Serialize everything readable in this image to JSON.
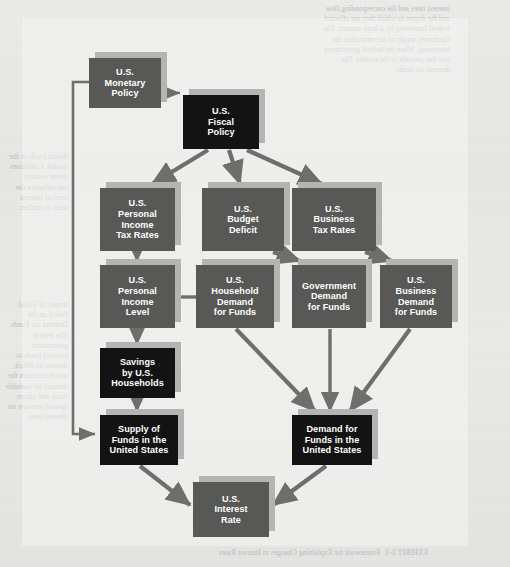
{
  "figure": {
    "background_color": "#e9e9e7",
    "panel_color": "#f4f4f2",
    "box_gray": "#585856",
    "box_black": "#131313",
    "box_shadow": "#b4b4b2",
    "connector_color": "#6e6e6c",
    "text_color": "#ffffff"
  },
  "nodes": [
    {
      "id": "monetary-policy",
      "label": "U.S.\nMonetary\nPolicy",
      "lines": [
        "U.S.",
        "Monetary",
        "Policy"
      ],
      "style": "gray",
      "x": 89,
      "y": 58,
      "w": 72,
      "h": 50
    },
    {
      "id": "fiscal-policy",
      "label": "U.S.\nFiscal\nPolicy",
      "lines": [
        "U.S.",
        "Fiscal",
        "Policy"
      ],
      "style": "black",
      "x": 183,
      "y": 95,
      "w": 76,
      "h": 54
    },
    {
      "id": "personal-income-tax-rates",
      "label": "U.S.\nPersonal\nIncome\nTax Rates",
      "lines": [
        "U.S.",
        "Personal",
        "Income",
        "Tax Rates"
      ],
      "style": "gray",
      "x": 100,
      "y": 188,
      "w": 75,
      "h": 63
    },
    {
      "id": "budget-deficit",
      "label": "U.S.\nBudget\nDeficit",
      "lines": [
        "U.S.",
        "Budget",
        "Deficit"
      ],
      "style": "gray",
      "x": 202,
      "y": 188,
      "w": 82,
      "h": 63
    },
    {
      "id": "business-tax-rates",
      "label": "U.S.\nBusiness\nTax Rates",
      "lines": [
        "U.S.",
        "Business",
        "Tax Rates"
      ],
      "style": "gray",
      "x": 292,
      "y": 188,
      "w": 84,
      "h": 63
    },
    {
      "id": "personal-income-level",
      "label": "U.S.\nPersonal\nIncome\nLevel",
      "lines": [
        "U.S.",
        "Personal",
        "Income",
        "Level"
      ],
      "style": "gray",
      "x": 100,
      "y": 265,
      "w": 75,
      "h": 63
    },
    {
      "id": "household-demand-for-funds",
      "label": "U.S.\nHousehold\nDemand\nfor Funds",
      "lines": [
        "U.S.",
        "Household",
        "Demand",
        "for Funds"
      ],
      "style": "gray",
      "x": 196,
      "y": 265,
      "w": 78,
      "h": 63
    },
    {
      "id": "government-demand-for-funds",
      "label": "Government\nDemand\nfor Funds",
      "lines": [
        "Government",
        "Demand",
        "for Funds"
      ],
      "style": "gray",
      "x": 292,
      "y": 265,
      "w": 74,
      "h": 63
    },
    {
      "id": "business-demand-for-funds",
      "label": "U.S.\nBusiness\nDemand\nfor Funds",
      "lines": [
        "U.S.",
        "Business",
        "Demand",
        "for Funds"
      ],
      "style": "gray",
      "x": 380,
      "y": 265,
      "w": 72,
      "h": 63
    },
    {
      "id": "savings-by-households",
      "label": "Savings\nby U.S.\nHouseholds",
      "lines": [
        "Savings",
        "by U.S.",
        "Households"
      ],
      "style": "black",
      "x": 100,
      "y": 348,
      "w": 75,
      "h": 50
    },
    {
      "id": "supply-of-funds",
      "label": "Supply of\nFunds in the\nUnited States",
      "lines": [
        "Supply of",
        "Funds in the",
        "United States"
      ],
      "style": "black",
      "x": 100,
      "y": 415,
      "w": 78,
      "h": 50
    },
    {
      "id": "demand-for-funds",
      "label": "Demand for\nFunds in the\nUnited States",
      "lines": [
        "Demand for",
        "Funds in the",
        "United States"
      ],
      "style": "black",
      "x": 292,
      "y": 415,
      "w": 80,
      "h": 50
    },
    {
      "id": "interest-rate",
      "label": "U.S.\nInterest\nRate",
      "lines": [
        "U.S.",
        "Interest",
        "Rate"
      ],
      "style": "gray",
      "x": 193,
      "y": 482,
      "w": 76,
      "h": 55
    }
  ],
  "edges": [
    {
      "id": "monetary-fiscal",
      "from": "monetary-policy",
      "to": "fiscal-policy",
      "arrow": "both"
    },
    {
      "id": "fiscal-personal-tax",
      "from": "fiscal-policy",
      "to": "personal-income-tax-rates",
      "arrow": "end"
    },
    {
      "id": "fiscal-budget-deficit",
      "from": "fiscal-policy",
      "to": "budget-deficit",
      "arrow": "end"
    },
    {
      "id": "fiscal-business-tax",
      "from": "fiscal-policy",
      "to": "business-tax-rates",
      "arrow": "end"
    },
    {
      "id": "personal-tax-personal-income",
      "from": "personal-income-tax-rates",
      "to": "personal-income-level",
      "arrow": "end"
    },
    {
      "id": "budget-deficit-government-demand",
      "from": "budget-deficit",
      "to": "government-demand-for-funds",
      "arrow": "end"
    },
    {
      "id": "business-tax-business-demand",
      "from": "business-tax-rates",
      "to": "business-demand-for-funds",
      "arrow": "end"
    },
    {
      "id": "personal-income-household-demand",
      "from": "personal-income-level",
      "to": "household-demand-for-funds",
      "arrow": "none"
    },
    {
      "id": "personal-income-savings",
      "from": "personal-income-level",
      "to": "savings-by-households",
      "arrow": "end"
    },
    {
      "id": "savings-supply",
      "from": "savings-by-households",
      "to": "supply-of-funds",
      "arrow": "end"
    },
    {
      "id": "household-demand-demand-funds",
      "from": "household-demand-for-funds",
      "to": "demand-for-funds",
      "arrow": "end"
    },
    {
      "id": "government-demand-demand-funds",
      "from": "government-demand-for-funds",
      "to": "demand-for-funds",
      "arrow": "end"
    },
    {
      "id": "business-demand-demand-funds",
      "from": "business-demand-for-funds",
      "to": "demand-for-funds",
      "arrow": "end"
    },
    {
      "id": "supply-interest-rate",
      "from": "supply-of-funds",
      "to": "interest-rate",
      "arrow": "end"
    },
    {
      "id": "demand-interest-rate",
      "from": "demand-for-funds",
      "to": "interest-rate",
      "arrow": "end"
    },
    {
      "id": "monetary-supply-feedback",
      "from": "monetary-policy",
      "to": "supply-of-funds",
      "arrow": "end"
    }
  ],
  "page_bleed_text": {
    "top_block": "interest rates and the corresponding flow\nand the degree to which they are affected\nfederal borrowing by a large amount. The\nthe money supply to accommodate the\nborrowing. When the federal government\nrate that prevails in the market. The\ndemand for funds.",
    "left_block_upper": "deficit levels in the\nmarket. Conditions\nin one country\ncan influence the\nlevel of interest\nrates in another.",
    "left_block_lower": "Impact of Fiscal\nPolicy on the\nDemand for Funds\nThe federal government\nborrows funds to\nfinance its deficit,\nwhich increases the\ndemand for loanable\nfunds and places\nupward pressure on\ninterest rates.",
    "caption": "EXHIBIT 3-3   Framework for Explaining Changes in Interest Rates"
  }
}
